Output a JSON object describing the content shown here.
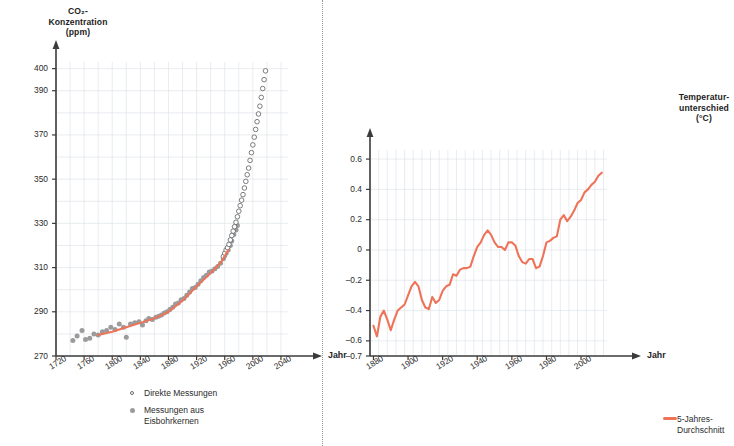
{
  "page": {
    "background": "#ffffff",
    "accent_orange": "#ef7359",
    "gray_dot": "#9b9b9b",
    "open_dot_stroke": "#6d6d6d",
    "axis_color": "#3b3b3b",
    "grid_color": "#dfe4ea"
  },
  "left_panel": {
    "axis_title": "CO₂-\nKonzentration\n(ppm)",
    "x_axis_name": "Jahr",
    "legend": [
      {
        "marker": "open-circle",
        "label": "Direkte Messungen"
      },
      {
        "marker": "filled-circle",
        "label": "Messungen aus\nEisbohrkernen"
      }
    ]
  },
  "right_panel": {
    "axis_title": "Temperatur-\nunterschied\n(°C)",
    "x_axis_name": "Jahr",
    "legend": [
      {
        "marker": "line",
        "label": "5-Jahres-Durchschnitt"
      }
    ]
  },
  "chart_data": [
    {
      "id": "co2",
      "type": "scatter",
      "title": "CO₂-Konzentration (ppm)",
      "xlabel": "Jahr",
      "ylabel": "CO₂-Konzentration (ppm)",
      "xlim": [
        1720,
        2050
      ],
      "ylim": [
        270,
        403
      ],
      "xticks": [
        1720,
        1760,
        1800,
        1840,
        1880,
        1920,
        1960,
        2000,
        2040
      ],
      "yticks": [
        270,
        290,
        310,
        330,
        350,
        370,
        390,
        400
      ],
      "grid": true,
      "grid_x_step": 20,
      "grid_y_step": 10,
      "legend_position": "bottom-center",
      "series": [
        {
          "name": "Messungen aus Eisbohrkernen",
          "marker": "filled-circle",
          "color": "#9b9b9b",
          "points": [
            [
              1744,
              277.0
            ],
            [
              1750,
              279.0
            ],
            [
              1757,
              281.5
            ],
            [
              1762,
              277.5
            ],
            [
              1768,
              278.0
            ],
            [
              1774,
              280.0
            ],
            [
              1780,
              279.5
            ],
            [
              1786,
              281.0
            ],
            [
              1792,
              281.5
            ],
            [
              1798,
              283.0
            ],
            [
              1804,
              282.0
            ],
            [
              1810,
              284.5
            ],
            [
              1816,
              283.0
            ],
            [
              1820,
              278.5
            ],
            [
              1826,
              284.5
            ],
            [
              1832,
              285.0
            ],
            [
              1838,
              285.5
            ],
            [
              1843,
              284.0
            ],
            [
              1848,
              286.0
            ],
            [
              1852,
              287.0
            ],
            [
              1857,
              286.5
            ],
            [
              1862,
              287.5
            ],
            [
              1866,
              288.0
            ],
            [
              1870,
              288.5
            ],
            [
              1874,
              289.5
            ],
            [
              1878,
              290.0
            ],
            [
              1882,
              291.0
            ],
            [
              1886,
              292.0
            ],
            [
              1890,
              293.5
            ],
            [
              1894,
              294.0
            ],
            [
              1898,
              295.5
            ],
            [
              1902,
              296.0
            ],
            [
              1906,
              297.5
            ],
            [
              1910,
              299.0
            ],
            [
              1914,
              300.5
            ],
            [
              1918,
              301.0
            ],
            [
              1922,
              302.5
            ],
            [
              1926,
              304.0
            ],
            [
              1930,
              305.5
            ],
            [
              1934,
              306.5
            ],
            [
              1938,
              308.0
            ],
            [
              1942,
              308.5
            ],
            [
              1946,
              309.5
            ],
            [
              1950,
              310.5
            ],
            [
              1954,
              312.0
            ],
            [
              1958,
              314.0
            ],
            [
              1960,
              315.5
            ],
            [
              1962,
              316.5
            ],
            [
              1965,
              318.0
            ],
            [
              1968,
              320.0
            ],
            [
              1970,
              322.0
            ],
            [
              1973,
              325.0
            ],
            [
              1976,
              327.0
            ],
            [
              1978,
              329.0
            ]
          ]
        },
        {
          "name": "Direkte Messungen",
          "marker": "open-circle",
          "color": "#6d6d6d",
          "points": [
            [
              1958,
              315.0
            ],
            [
              1960,
              316.5
            ],
            [
              1962,
              318.0
            ],
            [
              1964,
              319.0
            ],
            [
              1966,
              320.5
            ],
            [
              1968,
              322.5
            ],
            [
              1970,
              324.5
            ],
            [
              1972,
              326.5
            ],
            [
              1974,
              328.5
            ],
            [
              1976,
              330.5
            ],
            [
              1978,
              333.0
            ],
            [
              1980,
              335.5
            ],
            [
              1982,
              338.0
            ],
            [
              1984,
              340.5
            ],
            [
              1986,
              343.0
            ],
            [
              1988,
              346.0
            ],
            [
              1990,
              349.0
            ],
            [
              1992,
              352.0
            ],
            [
              1994,
              355.0
            ],
            [
              1996,
              358.5
            ],
            [
              1998,
              362.0
            ],
            [
              2000,
              365.5
            ],
            [
              2002,
              369.0
            ],
            [
              2004,
              372.5
            ],
            [
              2006,
              376.0
            ],
            [
              2008,
              379.5
            ],
            [
              2010,
              383.0
            ],
            [
              2012,
              387.0
            ],
            [
              2014,
              391.0
            ],
            [
              2016,
              395.0
            ],
            [
              2018,
              399.0
            ]
          ]
        },
        {
          "name": "Trendlinie",
          "marker": "line",
          "color": "#ef7359",
          "points": [
            [
              1780,
              279.5
            ],
            [
              1800,
              281.0
            ],
            [
              1820,
              283.0
            ],
            [
              1840,
              285.0
            ],
            [
              1860,
              287.0
            ],
            [
              1880,
              290.0
            ],
            [
              1900,
              295.0
            ],
            [
              1920,
              301.5
            ],
            [
              1940,
              307.5
            ],
            [
              1955,
              312.5
            ],
            [
              1965,
              318.0
            ]
          ]
        }
      ]
    },
    {
      "id": "temperature",
      "type": "line",
      "title": "Temperaturunterschied (°C)",
      "xlabel": "Jahr",
      "ylabel": "Temperaturunterschied (°C)",
      "xlim": [
        1878,
        2015
      ],
      "ylim": [
        -0.7,
        0.66
      ],
      "xticks": [
        1880,
        1900,
        1920,
        1940,
        1960,
        1980,
        2000
      ],
      "yticks": [
        0.6,
        0.4,
        0.2,
        0,
        -0.2,
        -0.4,
        -0.6,
        -0.7
      ],
      "grid": true,
      "grid_x_step": 5,
      "grid_y_step": 0.2,
      "legend_position": "bottom-left",
      "series": [
        {
          "name": "5-Jahres-Durchschnitt",
          "color": "#ef7359",
          "x": [
            1880,
            1882,
            1884,
            1886,
            1888,
            1890,
            1892,
            1894,
            1896,
            1898,
            1900,
            1902,
            1904,
            1906,
            1908,
            1910,
            1912,
            1914,
            1916,
            1918,
            1920,
            1922,
            1924,
            1926,
            1928,
            1930,
            1932,
            1934,
            1936,
            1938,
            1940,
            1942,
            1944,
            1946,
            1948,
            1950,
            1952,
            1954,
            1956,
            1958,
            1960,
            1962,
            1964,
            1966,
            1968,
            1970,
            1972,
            1974,
            1976,
            1978,
            1980,
            1982,
            1984,
            1986,
            1988,
            1990,
            1992,
            1994,
            1996,
            1998,
            2000,
            2002,
            2004,
            2006,
            2008,
            2010,
            2012
          ],
          "values": [
            -0.5,
            -0.57,
            -0.44,
            -0.4,
            -0.46,
            -0.53,
            -0.46,
            -0.4,
            -0.38,
            -0.36,
            -0.3,
            -0.24,
            -0.21,
            -0.24,
            -0.33,
            -0.38,
            -0.39,
            -0.31,
            -0.35,
            -0.33,
            -0.27,
            -0.24,
            -0.23,
            -0.16,
            -0.17,
            -0.13,
            -0.12,
            -0.12,
            -0.11,
            -0.04,
            0.02,
            0.05,
            0.1,
            0.13,
            0.1,
            0.05,
            0.02,
            0.02,
            0.0,
            0.05,
            0.05,
            0.03,
            -0.04,
            -0.08,
            -0.09,
            -0.06,
            -0.06,
            -0.12,
            -0.11,
            -0.04,
            0.05,
            0.06,
            0.08,
            0.09,
            0.2,
            0.23,
            0.19,
            0.22,
            0.26,
            0.31,
            0.33,
            0.38,
            0.4,
            0.43,
            0.45,
            0.49,
            0.51
          ]
        }
      ]
    }
  ]
}
